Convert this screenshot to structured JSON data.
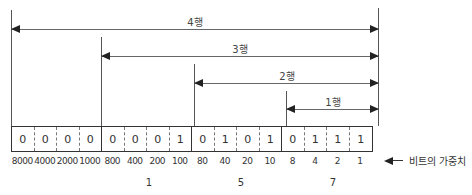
{
  "diagram": {
    "type": "bcd-bit-weights",
    "ranges": [
      {
        "label": "4행",
        "start_col": 0,
        "end_col": 16
      },
      {
        "label": "3행",
        "start_col": 4,
        "end_col": 16
      },
      {
        "label": "2행",
        "start_col": 8,
        "end_col": 16
      },
      {
        "label": "1행",
        "start_col": 12,
        "end_col": 16
      }
    ],
    "bits": [
      "0",
      "0",
      "0",
      "0",
      "0",
      "0",
      "0",
      "1",
      "0",
      "1",
      "0",
      "1",
      "0",
      "1",
      "1",
      "1"
    ],
    "weights": [
      "8000",
      "4000",
      "2000",
      "1000",
      "800",
      "400",
      "200",
      "100",
      "80",
      "40",
      "20",
      "10",
      "8",
      "4",
      "2",
      "1"
    ],
    "group_digits": [
      {
        "group": 1,
        "value": "1"
      },
      {
        "group": 2,
        "value": "5"
      },
      {
        "group": 3,
        "value": "7"
      }
    ],
    "legend": {
      "label": "비트의 가중치",
      "icon": "left-arrow-icon"
    }
  }
}
